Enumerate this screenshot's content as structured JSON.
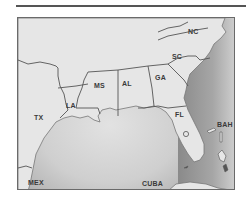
{
  "map": {
    "region": "Southeastern United States and Gulf of Mexico",
    "labels": {
      "nc": "NC",
      "sc": "SC",
      "ga": "GA",
      "al": "AL",
      "ms": "MS",
      "la": "LA",
      "tx": "TX",
      "fl": "FL",
      "bah": "BAH",
      "mex": "MEX",
      "cuba": "CUBA"
    },
    "colors": {
      "land": "#e6e6e6",
      "water_dark": "#8e8e8e",
      "water_light": "#d4d4d4",
      "border": "#555555",
      "frame": "#6a6a6a"
    }
  }
}
